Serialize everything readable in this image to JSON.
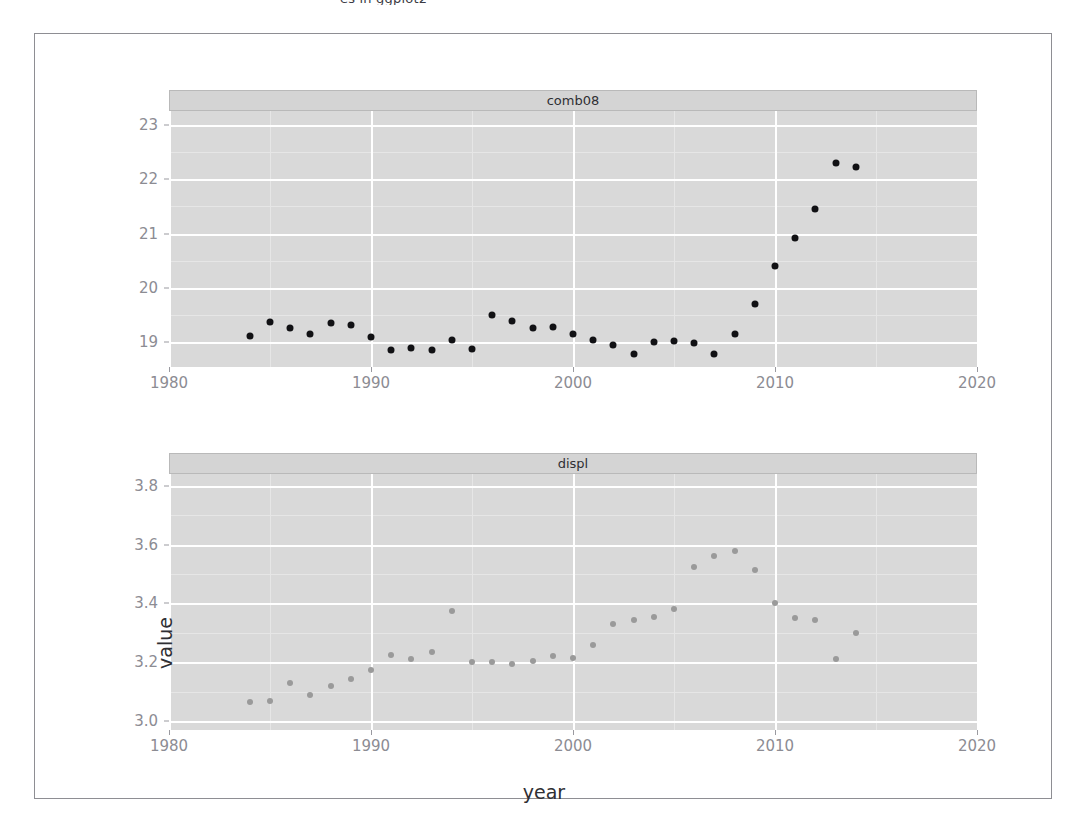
{
  "top_clipped_text": "es in ggplot2",
  "figure": {
    "x_axis_title": "year",
    "y_axis_title": "value"
  },
  "chart_data": [
    {
      "type": "scatter",
      "title": "comb08",
      "panel_label": "comb08",
      "xlabel": "year",
      "ylabel": "value",
      "xlim": [
        1980,
        2020
      ],
      "ylim": [
        18.55,
        23.25
      ],
      "x_ticks": [
        1980,
        1990,
        2000,
        2010,
        2020
      ],
      "x_tick_labels": [
        "1980",
        "1990",
        "2000",
        "2010",
        "2020"
      ],
      "y_ticks": [
        19,
        20,
        21,
        22,
        23
      ],
      "y_tick_labels": [
        "19",
        "20",
        "21",
        "22",
        "23"
      ],
      "grid": true,
      "legend": "none",
      "point_color": "#111114",
      "x": [
        1984,
        1985,
        1986,
        1987,
        1988,
        1989,
        1990,
        1991,
        1992,
        1993,
        1994,
        1995,
        1996,
        1997,
        1998,
        1999,
        2000,
        2001,
        2002,
        2003,
        2004,
        2005,
        2006,
        2007,
        2008,
        2009,
        2010,
        2011,
        2012,
        2013,
        2014
      ],
      "y": [
        19.12,
        19.38,
        19.27,
        19.15,
        19.35,
        19.33,
        19.1,
        18.87,
        18.9,
        18.87,
        19.05,
        18.88,
        19.5,
        19.4,
        19.27,
        19.28,
        19.16,
        19.04,
        18.95,
        18.78,
        19.0,
        19.03,
        18.99,
        18.78,
        19.16,
        19.7,
        20.4,
        20.92,
        21.45,
        22.3,
        22.22
      ]
    },
    {
      "type": "scatter",
      "title": "displ",
      "panel_label": "displ",
      "xlabel": "year",
      "ylabel": "value",
      "xlim": [
        1980,
        2020
      ],
      "ylim": [
        2.97,
        3.84
      ],
      "x_ticks": [
        1980,
        1990,
        2000,
        2010,
        2020
      ],
      "x_tick_labels": [
        "1980",
        "1990",
        "2000",
        "2010",
        "2020"
      ],
      "y_ticks": [
        3.0,
        3.2,
        3.4,
        3.6,
        3.8
      ],
      "y_tick_labels": [
        "3.0",
        "3.2",
        "3.4",
        "3.6",
        "3.8"
      ],
      "grid": true,
      "legend": "none",
      "point_color": "#9a9a9a",
      "x": [
        1984,
        1985,
        1986,
        1987,
        1988,
        1989,
        1990,
        1991,
        1992,
        1993,
        1994,
        1995,
        1996,
        1997,
        1998,
        1999,
        2000,
        2001,
        2002,
        2003,
        2004,
        2005,
        2006,
        2007,
        2008,
        2009,
        2010,
        2011,
        2012,
        2013,
        2014
      ],
      "y": [
        3.065,
        3.07,
        3.13,
        3.09,
        3.12,
        3.145,
        3.175,
        3.225,
        3.21,
        3.235,
        3.375,
        3.2,
        3.2,
        3.195,
        3.205,
        3.22,
        3.215,
        3.26,
        3.33,
        3.345,
        3.355,
        3.38,
        3.525,
        3.56,
        3.58,
        3.515,
        3.4,
        3.35,
        3.345,
        3.21,
        3.3
      ]
    }
  ]
}
